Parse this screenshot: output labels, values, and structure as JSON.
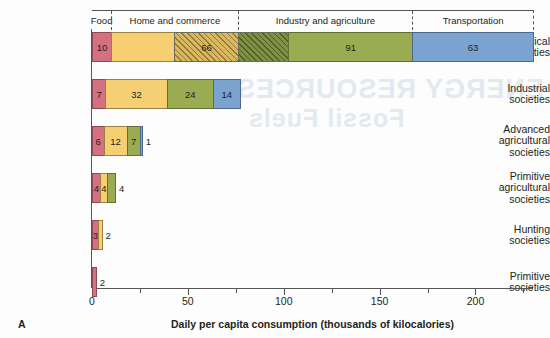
{
  "figure": {
    "panel_letter": "A",
    "x_axis_title": "Daily per capita consumption (thousands of kilocalories)"
  },
  "header": {
    "categories": [
      {
        "label": "Food",
        "start": 0,
        "end": 10
      },
      {
        "label": "Home and commerce",
        "start": 10,
        "end": 76
      },
      {
        "label": "Industry and agriculture",
        "start": 76,
        "end": 167
      },
      {
        "label": "Transportation",
        "start": 167,
        "end": 230
      }
    ]
  },
  "colors": {
    "food": "#d4707f",
    "home_and_commerce": "#f6cf72",
    "industry_and_agriculture": "#9aab52",
    "transportation": "#7ba3d0",
    "hatch_yellow": "#d9b95f",
    "hatch_olive": "#7f9144",
    "axis": "#555555",
    "background": "#fdfdfd"
  },
  "chart_data": {
    "type": "bar",
    "orientation": "horizontal",
    "stacked": true,
    "title": "",
    "xlabel": "Daily per capita consumption (thousands of kilocalories)",
    "ylabel": "",
    "xlim": [
      0,
      230
    ],
    "xticks": [
      0,
      50,
      100,
      150,
      200
    ],
    "xtick_labels": [
      "0",
      "50",
      "100",
      "150",
      "200"
    ],
    "minor_xticks": [
      25,
      75,
      125,
      175,
      225
    ],
    "grid": false,
    "legend": "top header band",
    "categories": [
      "Food",
      "Home and commerce",
      "Industry and agriculture",
      "Transportation"
    ],
    "rows": [
      {
        "label": "Technological societies",
        "label_lines": [
          "Technological",
          "societies"
        ],
        "total": 230,
        "segments": [
          {
            "category": "Food",
            "value": 10,
            "label": "10",
            "style": "solid",
            "color": "#d4707f",
            "label_inside": true
          },
          {
            "category": "Home and commerce",
            "value": 66,
            "label": "66",
            "style": "split",
            "color": "#f6cf72",
            "label_inside": true,
            "note": "drawn as solid yellow then diagonally hatched yellow"
          },
          {
            "category": "Industry and agriculture",
            "value": 91,
            "label": "91",
            "style": "split",
            "color": "#9aab52",
            "label_inside": true,
            "note": "drawn as diagonally hatched olive then solid olive"
          },
          {
            "category": "Transportation",
            "value": 63,
            "label": "63",
            "style": "solid",
            "color": "#7ba3d0",
            "label_inside": true
          }
        ]
      },
      {
        "label": "Industrial societies",
        "label_lines": [
          "Industrial",
          "societies"
        ],
        "total": 77,
        "segments": [
          {
            "category": "Food",
            "value": 7,
            "label": "7",
            "style": "solid",
            "color": "#d4707f",
            "label_inside": true
          },
          {
            "category": "Home and commerce",
            "value": 32,
            "label": "32",
            "style": "solid",
            "color": "#f6cf72",
            "label_inside": true
          },
          {
            "category": "Industry and agriculture",
            "value": 24,
            "label": "24",
            "style": "solid",
            "color": "#9aab52",
            "label_inside": true
          },
          {
            "category": "Transportation",
            "value": 14,
            "label": "14",
            "style": "solid",
            "color": "#7ba3d0",
            "label_inside": true
          }
        ]
      },
      {
        "label": "Advanced agricultural societies",
        "label_lines": [
          "Advanced",
          "agricultural",
          "societies"
        ],
        "total": 26,
        "segments": [
          {
            "category": "Food",
            "value": 6,
            "label": "6",
            "style": "solid",
            "color": "#d4707f",
            "label_inside": true
          },
          {
            "category": "Home and commerce",
            "value": 12,
            "label": "12",
            "style": "solid",
            "color": "#f6cf72",
            "label_inside": true
          },
          {
            "category": "Industry and agriculture",
            "value": 7,
            "label": "7",
            "style": "solid",
            "color": "#9aab52",
            "label_inside": true
          },
          {
            "category": "Transportation",
            "value": 1,
            "label": "1",
            "style": "solid",
            "color": "#7ba3d0",
            "label_inside": false
          }
        ]
      },
      {
        "label": "Primitive agricultural societies",
        "label_lines": [
          "Primitive",
          "agricultural",
          "societies"
        ],
        "total": 12,
        "segments": [
          {
            "category": "Food",
            "value": 4,
            "label": "4",
            "style": "solid",
            "color": "#d4707f",
            "label_inside": true
          },
          {
            "category": "Home and commerce",
            "value": 4,
            "label": "4",
            "style": "solid",
            "color": "#f6cf72",
            "label_inside": true
          },
          {
            "category": "Industry and agriculture",
            "value": 4,
            "label": "4",
            "style": "solid",
            "color": "#9aab52",
            "label_inside": false
          }
        ]
      },
      {
        "label": "Hunting societies",
        "label_lines": [
          "Hunting",
          "societies"
        ],
        "total": 5,
        "segments": [
          {
            "category": "Food",
            "value": 3,
            "label": "3",
            "style": "solid",
            "color": "#d4707f",
            "label_inside": true
          },
          {
            "category": "Home and commerce",
            "value": 2,
            "label": "2",
            "style": "solid",
            "color": "#f6cf72",
            "label_inside": false
          }
        ]
      },
      {
        "label": "Primitive societies",
        "label_lines": [
          "Primitive",
          "societies"
        ],
        "total": 2,
        "segments": [
          {
            "category": "Food",
            "value": 2,
            "label": "2",
            "style": "solid",
            "color": "#d4707f",
            "label_inside": false
          }
        ]
      }
    ]
  },
  "bleed_through": {
    "line1": "ENERGY RESOURCES",
    "line2": "Fossil Fuels"
  }
}
